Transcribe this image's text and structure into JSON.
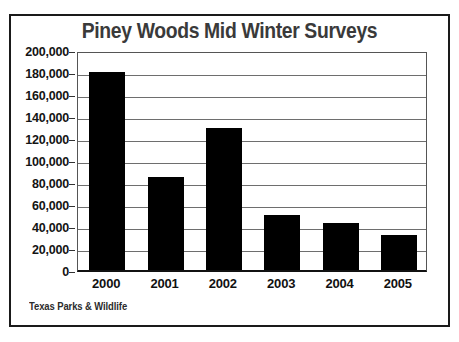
{
  "chart_data": {
    "type": "bar",
    "title": "Piney Woods Mid Winter Surveys",
    "xlabel": "",
    "ylabel": "",
    "categories": [
      "2000",
      "2001",
      "2002",
      "2003",
      "2004",
      "2005"
    ],
    "values": [
      180000,
      85000,
      129000,
      50000,
      43000,
      32000
    ],
    "ylim": [
      0,
      200000
    ],
    "ytick_step": 20000,
    "ytick_labels": [
      "200,000",
      "180,000",
      "160,000",
      "140,000",
      "120,000",
      "100,000",
      "80,000",
      "60,000",
      "40,000",
      "20,000",
      "0"
    ],
    "grid": true,
    "legend": false,
    "legend_position": "none",
    "bar_color": "#000000",
    "gridline_color": "#6e6e6e",
    "title_color": "#3a3a3a",
    "axis_color": "#111111",
    "source_note": "Texas Parks & Wildlife"
  }
}
